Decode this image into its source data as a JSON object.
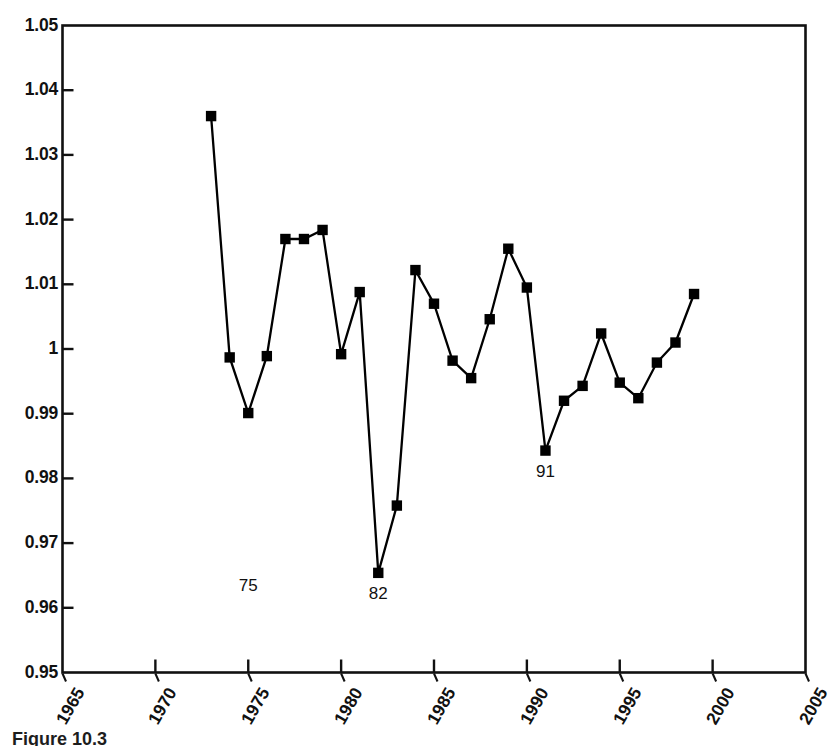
{
  "caption": {
    "text": "Figure 10.3"
  },
  "axes": {
    "y_tick_labels": [
      "1.05",
      "1.04",
      "1.03",
      "1.02",
      "1.01",
      "1",
      "0.99",
      "0.98",
      "0.97",
      "0.96",
      "0.95"
    ],
    "x_tick_labels": [
      "1965",
      "1970",
      "1975",
      "1980",
      "1985",
      "1990",
      "1995",
      "2000",
      "2005"
    ]
  },
  "chart_data": {
    "type": "line",
    "title": "",
    "subtitle": "",
    "xlabel": "",
    "ylabel": "",
    "xlim": [
      1965,
      2005
    ],
    "ylim": [
      0.95,
      1.05
    ],
    "x_ticks": [
      1965,
      1970,
      1975,
      1980,
      1985,
      1990,
      1995,
      2000,
      2005
    ],
    "y_ticks": [
      0.95,
      0.96,
      0.97,
      0.98,
      0.99,
      1.0,
      1.01,
      1.02,
      1.03,
      1.04,
      1.05
    ],
    "grid": false,
    "legend": "none",
    "marker": "filled-square",
    "line_color": "#000000",
    "marker_color": "#000000",
    "x": [
      1973,
      1974,
      1975,
      1976,
      1977,
      1978,
      1979,
      1980,
      1981,
      1982,
      1983,
      1984,
      1985,
      1986,
      1987,
      1988,
      1989,
      1990,
      1991,
      1992,
      1993,
      1994,
      1995,
      1996,
      1997,
      1998,
      1999
    ],
    "values": [
      1.036,
      0.9987,
      0.9901,
      0.9989,
      1.017,
      1.017,
      1.0184,
      0.9992,
      1.0088,
      0.9654,
      0.9758,
      1.0122,
      1.007,
      0.9982,
      0.9955,
      1.0046,
      1.0155,
      1.0095,
      0.9843,
      0.992,
      0.9943,
      1.0024,
      0.9948,
      0.9924,
      0.9979,
      1.001,
      1.0085
    ],
    "series": [
      {
        "name": "ratio",
        "values": [
          1.036,
          0.9987,
          0.9901,
          0.9989,
          1.017,
          1.017,
          1.0184,
          0.9992,
          1.0088,
          0.9654,
          0.9758,
          1.0122,
          1.007,
          0.9982,
          0.9955,
          1.0046,
          1.0155,
          1.0095,
          0.9843,
          0.992,
          0.9943,
          1.0024,
          0.9948,
          0.9924,
          0.9979,
          1.001,
          1.0085
        ]
      }
    ],
    "annotations": [
      {
        "label": "75",
        "x": 1975,
        "y": 0.9666
      },
      {
        "label": "82",
        "x": 1982,
        "y": 0.9654
      },
      {
        "label": "91",
        "x": 1991,
        "y": 0.9843
      }
    ]
  }
}
